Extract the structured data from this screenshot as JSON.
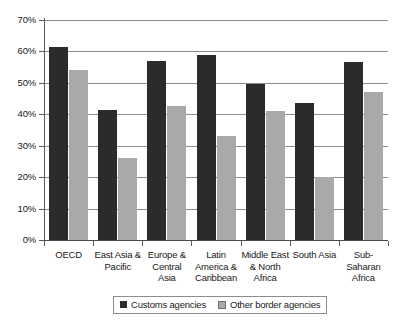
{
  "chart_data": {
    "type": "bar",
    "title": "",
    "subtitle": "",
    "xlabel": "",
    "ylabel": "",
    "ylim": [
      0,
      70
    ],
    "ytick_values": [
      0,
      10,
      20,
      30,
      40,
      50,
      60,
      70
    ],
    "ytick_labels": [
      "0%",
      "10%",
      "20%",
      "30%",
      "40%",
      "50%",
      "60%",
      "70%"
    ],
    "grid": true,
    "legend_position": "bottom",
    "categories": [
      "OECD",
      "East Asia & Pacific",
      "Europe & Central Asia",
      "Latin America & Caribbean",
      "Middle East & North Africa",
      "South Asia",
      "Sub-Saharan Africa"
    ],
    "category_label_lines": [
      [
        "OECD"
      ],
      [
        "East Asia &",
        "Pacific"
      ],
      [
        "Europe &",
        "Central",
        "Asia"
      ],
      [
        "Latin",
        "America &",
        "Caribbean"
      ],
      [
        "Middle East",
        "& North",
        "Africa"
      ],
      [
        "South Asia"
      ],
      [
        "Sub-",
        "Saharan",
        "Africa"
      ]
    ],
    "series": [
      {
        "name": "Customs agencies",
        "color": "#2b2b2b",
        "values": [
          61.5,
          41.5,
          57.0,
          59.0,
          49.5,
          43.5,
          56.5
        ]
      },
      {
        "name": "Other border agencies",
        "color": "#a9a9a9",
        "values": [
          54.0,
          26.0,
          42.5,
          33.0,
          41.0,
          20.0,
          47.0
        ]
      }
    ]
  },
  "legend": {
    "entries": [
      {
        "label": "Customs agencies",
        "swatch": "customs"
      },
      {
        "label": "Other border agencies",
        "swatch": "other"
      }
    ]
  }
}
